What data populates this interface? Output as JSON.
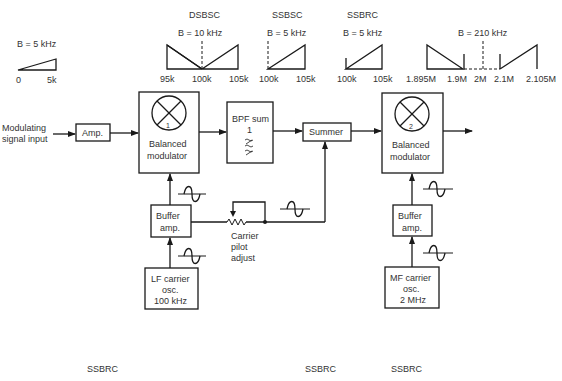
{
  "spectra": {
    "baseband": {
      "bandwidth": "B = 5 kHz",
      "ticks": [
        "0",
        "5k"
      ]
    },
    "dsbsc": {
      "title": "DSBSC",
      "bandwidth": "B = 10 kHz",
      "ticks": [
        "95k",
        "100k",
        "105k"
      ]
    },
    "ssbsc": {
      "title": "SSBSC",
      "bandwidth": "B = 5 kHz",
      "ticks": [
        "100k",
        "105k"
      ]
    },
    "ssbrc": {
      "title": "SSBRC",
      "bandwidth": "B = 5 kHz",
      "ticks": [
        "100k",
        "105k"
      ]
    },
    "output": {
      "bandwidth": "B = 210 kHz",
      "ticks": [
        "1.895M",
        "1.9M",
        "2M",
        "2.1M",
        "2.105M"
      ]
    }
  },
  "blocks": {
    "input_label_1": "Modulating",
    "input_label_2": "signal input",
    "amp": "Amp.",
    "bm1_number": "1",
    "bm1_label_1": "Balanced",
    "bm1_label_2": "modulator",
    "bpf_label_1": "BPF sum",
    "bpf_label_2": "1",
    "summer": "Summer",
    "bm2_number": "2",
    "bm2_label_1": "Balanced",
    "bm2_label_2": "modulator",
    "buffer1_label_1": "Buffer",
    "buffer1_label_2": "amp.",
    "pilot_label_1": "Carrier",
    "pilot_label_2": "pilot",
    "pilot_label_3": "adjust",
    "lfosc_label_1": "LF carrier",
    "lfosc_label_2": "osc.",
    "lfosc_label_3": "100 kHz",
    "buffer2_label_1": "Buffer",
    "buffer2_label_2": "amp.",
    "mfosc_label_1": "MF carrier",
    "mfosc_label_2": "osc.",
    "mfosc_label_3": "2 MHz"
  },
  "footer": {
    "labels": [
      "SSBRC",
      "SSBRC",
      "SSBRC"
    ]
  }
}
